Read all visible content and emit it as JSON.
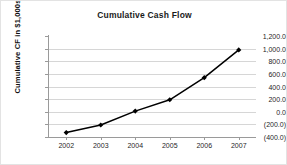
{
  "chart_data": {
    "type": "line",
    "title": "Cumulative Cash Flow",
    "xlabel": "",
    "ylabel": "Cumulative CF in $1,000s",
    "categories": [
      "2002",
      "2003",
      "2004",
      "2005",
      "2006",
      "2007"
    ],
    "values": [
      -330,
      -210,
      10,
      190,
      540,
      980
    ],
    "series": [
      {
        "name": "Cumulative Cash Flow",
        "values": [
          -330,
          -210,
          10,
          190,
          540,
          980
        ]
      }
    ],
    "ylim": [
      -400,
      1200
    ],
    "ytick_values": [
      1200,
      1000,
      800,
      600,
      400,
      200,
      0,
      -200,
      -400
    ],
    "ytick_labels": [
      "1,200.0",
      "1,000.0",
      "800.0",
      "600.0",
      "400.0",
      "200.0",
      "0.0",
      "(200.0)",
      "(400.0)"
    ],
    "grid": true,
    "legend": false,
    "legend_position": "none",
    "marker": "diamond",
    "line_color": "#000000",
    "grid_color": "#d6d6d6",
    "axis_color": "#9a9a9a",
    "background_color": "#ffffff"
  }
}
